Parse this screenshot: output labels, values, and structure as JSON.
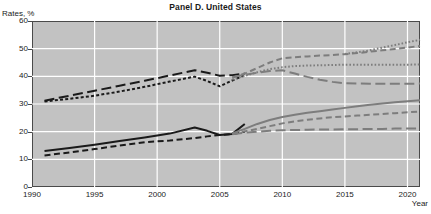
{
  "chart_data": {
    "type": "line",
    "title": "Panel D. United States",
    "xlabel": "Year",
    "ylabel": "Rates, %",
    "xlim": [
      1990,
      2021
    ],
    "ylim": [
      0,
      60
    ],
    "grid": true,
    "legend": "none",
    "background_color": "#c2c2c2",
    "gridline_color": "#ffffff",
    "axis_color": "#4a4a4a",
    "xticks": [
      1990,
      1995,
      2000,
      2005,
      2010,
      2015,
      2020
    ],
    "yticks": [
      0,
      10,
      20,
      30,
      40,
      50,
      60
    ],
    "series": [
      {
        "name": "upper-long-dash-black",
        "color": "#1a1a1a",
        "dash": "long-dash",
        "width": 2.0,
        "x": [
          1991,
          1993,
          1995,
          1997,
          1999,
          2001,
          2003,
          2004,
          2005,
          2006,
          2007
        ],
        "values": [
          31.2,
          33.0,
          34.8,
          36.6,
          38.4,
          40.3,
          42.2,
          41.3,
          40.2,
          40.4,
          41.0
        ]
      },
      {
        "name": "upper-dotted-black",
        "color": "#1a1a1a",
        "dash": "dotted",
        "width": 2.0,
        "x": [
          1991,
          1993,
          1995,
          1997,
          1999,
          2001,
          2003,
          2004,
          2005,
          2006,
          2007
        ],
        "values": [
          30.9,
          31.9,
          33.0,
          34.5,
          36.2,
          38.1,
          39.9,
          38.3,
          36.4,
          38.5,
          40.4
        ]
      },
      {
        "name": "lower-solid-black",
        "color": "#1a1a1a",
        "dash": "solid",
        "width": 2.0,
        "x": [
          1991,
          1993,
          1995,
          1997,
          1999,
          2001,
          2003,
          2004,
          2005,
          2006,
          2007
        ],
        "values": [
          13.0,
          14.1,
          15.3,
          16.6,
          17.9,
          19.3,
          21.5,
          20.3,
          18.8,
          19.2,
          22.8
        ]
      },
      {
        "name": "lower-dashed-black",
        "color": "#1a1a1a",
        "dash": "dash",
        "width": 2.0,
        "x": [
          1991,
          1993,
          1995,
          1997,
          1999,
          2001,
          2003,
          2004,
          2005,
          2006,
          2007
        ],
        "values": [
          11.4,
          12.5,
          13.7,
          15.0,
          16.2,
          16.8,
          17.7,
          18.3,
          18.8,
          19.1,
          20.0
        ]
      },
      {
        "name": "upper-gray-medium-dash-rising",
        "color": "#7d7d7d",
        "dash": "dash",
        "width": 2.0,
        "x": [
          2006,
          2007,
          2008,
          2009,
          2010,
          2011,
          2012,
          2013,
          2014,
          2015,
          2016,
          2017,
          2018,
          2019,
          2020,
          2021
        ],
        "values": [
          39.5,
          41.0,
          43.0,
          45.0,
          46.5,
          46.9,
          47.2,
          47.5,
          47.7,
          48.0,
          48.4,
          48.9,
          49.4,
          49.9,
          50.4,
          51.0
        ]
      },
      {
        "name": "upper-gray-fine-dotted-flat",
        "color": "#7d7d7d",
        "dash": "fine-dot",
        "width": 2.0,
        "x": [
          2006,
          2007,
          2008,
          2009,
          2010,
          2011,
          2012,
          2013,
          2014,
          2015,
          2016,
          2017,
          2018,
          2019,
          2020,
          2021
        ],
        "values": [
          38.8,
          40.2,
          41.5,
          42.6,
          43.3,
          43.7,
          43.9,
          44.0,
          44.1,
          44.2,
          44.2,
          44.2,
          44.2,
          44.2,
          44.2,
          44.3
        ]
      },
      {
        "name": "upper-gray-long-dash-declining",
        "color": "#7d7d7d",
        "dash": "long-dash",
        "width": 2.0,
        "x": [
          2006,
          2007,
          2008,
          2009,
          2010,
          2011,
          2012,
          2013,
          2014,
          2015,
          2016,
          2017,
          2018,
          2019,
          2020,
          2021
        ],
        "values": [
          39.8,
          40.6,
          41.3,
          41.9,
          42.2,
          41.0,
          39.8,
          38.8,
          38.0,
          37.5,
          37.4,
          37.3,
          37.3,
          37.3,
          37.3,
          37.4
        ]
      },
      {
        "name": "upper-gray-dotted-rising-top",
        "color": "#7d7d7d",
        "dash": "fine-dot",
        "width": 2.0,
        "x": [
          2015,
          2016,
          2017,
          2018,
          2019,
          2020,
          2021
        ],
        "values": [
          48.1,
          48.7,
          49.4,
          50.4,
          51.3,
          52.3,
          53.2
        ]
      },
      {
        "name": "lower-gray-solid-rising",
        "color": "#7d7d7d",
        "dash": "solid",
        "width": 2.0,
        "x": [
          2006,
          2007,
          2008,
          2009,
          2010,
          2011,
          2012,
          2013,
          2014,
          2015,
          2016,
          2017,
          2018,
          2019,
          2020,
          2021
        ],
        "values": [
          19.4,
          21.0,
          22.8,
          24.2,
          25.3,
          26.1,
          26.8,
          27.4,
          28.0,
          28.6,
          29.2,
          29.7,
          30.2,
          30.6,
          31.0,
          31.4
        ]
      },
      {
        "name": "lower-gray-medium-dash",
        "color": "#7d7d7d",
        "dash": "dash",
        "width": 2.0,
        "x": [
          2006,
          2007,
          2008,
          2009,
          2010,
          2011,
          2012,
          2013,
          2014,
          2015,
          2016,
          2017,
          2018,
          2019,
          2020,
          2021
        ],
        "values": [
          19.2,
          20.1,
          21.0,
          22.0,
          23.0,
          23.7,
          24.3,
          24.8,
          25.2,
          25.5,
          25.8,
          26.1,
          26.4,
          26.7,
          27.0,
          27.3
        ]
      },
      {
        "name": "lower-gray-long-dash-flat",
        "color": "#7d7d7d",
        "dash": "long-dash",
        "width": 2.0,
        "x": [
          2006,
          2007,
          2008,
          2009,
          2010,
          2011,
          2012,
          2013,
          2014,
          2015,
          2016,
          2017,
          2018,
          2019,
          2020,
          2021
        ],
        "values": [
          19.1,
          19.6,
          20.0,
          20.3,
          20.5,
          20.6,
          20.7,
          20.8,
          20.8,
          20.9,
          20.9,
          21.0,
          21.0,
          21.1,
          21.1,
          21.2
        ]
      }
    ]
  }
}
